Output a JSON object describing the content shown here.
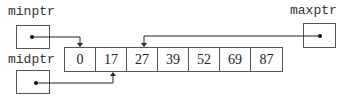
{
  "pointers": {
    "min": {
      "label": "minptr"
    },
    "mid": {
      "label": "midptr"
    },
    "max": {
      "label": "maxptr"
    }
  },
  "array": {
    "values": [
      "0",
      "17",
      "27",
      "39",
      "52",
      "69",
      "87"
    ]
  },
  "arrows": [
    {
      "from": "minptr",
      "to_index": 0
    },
    {
      "from": "midptr",
      "to_index": 1
    },
    {
      "from": "maxptr",
      "to_index": 2
    }
  ]
}
